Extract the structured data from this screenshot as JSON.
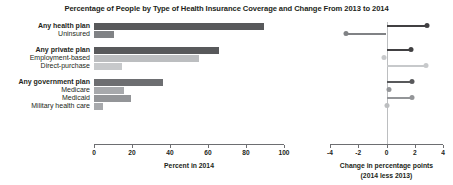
{
  "chart_data": {
    "type": "bar",
    "title": "Percentage of People by Type of Health Insurance Coverage and Change From 2013 to 2014",
    "categories": [
      "Any health plan",
      "Uninsured",
      "Any private plan",
      "Employment-based",
      "Direct-purchase",
      "Any government plan",
      "Medicare",
      "Medicaid",
      "Military health care"
    ],
    "bold_categories": [
      "Any health plan",
      "Any private plan",
      "Any government plan"
    ],
    "group_breaks_after": [
      "Uninsured",
      "Direct-purchase"
    ],
    "series": [
      {
        "name": "Percent in 2014",
        "panel": "left",
        "values": [
          89.6,
          10.4,
          65.6,
          55.4,
          14.6,
          36.5,
          16.0,
          19.5,
          4.5
        ]
      },
      {
        "name": "Change in percentage points (2014 less 2013)",
        "panel": "right",
        "values": [
          2.9,
          -2.9,
          1.7,
          -0.2,
          2.8,
          1.8,
          0.2,
          1.8,
          0.0
        ]
      }
    ],
    "bar_colors": [
      "#58595b",
      "#808285",
      "#58595b",
      "#bcbec0",
      "#c7c9cb",
      "#6d6e71",
      "#a7a9ac",
      "#939598",
      "#a7a9ac"
    ],
    "dot_colors": [
      "#414042",
      "#808285",
      "#414042",
      "#c7c9cb",
      "#c7c9cb",
      "#58595b",
      "#939598",
      "#939598",
      "#bcbec0"
    ],
    "left_axis": {
      "label": "Percent in 2014",
      "xlim": [
        0,
        100
      ],
      "ticks": [
        0,
        20,
        40,
        60,
        80,
        100
      ],
      "ticklabels": [
        "0",
        "20",
        "40",
        "60",
        "80",
        "100"
      ]
    },
    "right_axis": {
      "label_line1": "Change in percentage points",
      "label_line2": "(2014 less 2013)",
      "xlim": [
        -4,
        4
      ],
      "ticks": [
        -4,
        -2,
        0,
        2,
        4
      ],
      "ticklabels": [
        "-4",
        "-2",
        "0",
        "2",
        "4"
      ],
      "zero_reference": 0
    },
    "grid": false,
    "legend": "none"
  }
}
